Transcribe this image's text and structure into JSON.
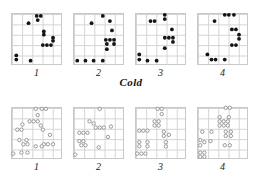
{
  "figure": {
    "title": "",
    "width": 262,
    "height": 189,
    "grid_rows": 5,
    "grid_cols": 5,
    "marker_colors": {
      "cold": "#141414",
      "warm": "#8e8e8e"
    },
    "grid_color": "#d2d2d2",
    "border_color": "#c9c9c9"
  },
  "groups": [
    {
      "key": "cold",
      "label": "Cold",
      "marker": "filled-circle"
    },
    {
      "key": "warm",
      "label": "Warm",
      "marker": "open-circle"
    }
  ],
  "panel_labels": [
    "1",
    "2",
    "3",
    "4"
  ],
  "chart_data": {
    "type": "scatter",
    "title": "",
    "xlabel": "",
    "ylabel": "",
    "xlim": [
      0,
      5
    ],
    "ylim": [
      0,
      5
    ],
    "grid": true,
    "legend": "none",
    "annotations": [
      "Cold",
      "Warm",
      "1",
      "2",
      "3",
      "4"
    ],
    "panels": [
      {
        "group": "Cold",
        "label": "1",
        "marker": "filled-circle",
        "points": [
          [
            2.52,
            4.72
          ],
          [
            2.92,
            4.72
          ],
          [
            2.62,
            4.32
          ],
          [
            1.72,
            4.02
          ],
          [
            3.22,
            3.22
          ],
          [
            3.22,
            2.92
          ],
          [
            4.12,
            2.62
          ],
          [
            4.12,
            2.32
          ],
          [
            3.12,
            1.92
          ],
          [
            3.52,
            1.92
          ],
          [
            3.92,
            1.92
          ],
          [
            0.52,
            0.92
          ],
          [
            0.52,
            0.52
          ],
          [
            1.92,
            0.42
          ]
        ]
      },
      {
        "group": "Cold",
        "label": "2",
        "marker": "filled-circle",
        "points": [
          [
            2.92,
            4.72
          ],
          [
            3.62,
            4.22
          ],
          [
            1.82,
            4.02
          ],
          [
            3.82,
            3.32
          ],
          [
            3.22,
            2.42
          ],
          [
            3.62,
            2.42
          ],
          [
            4.02,
            2.42
          ],
          [
            3.32,
            2.02
          ],
          [
            4.02,
            2.02
          ],
          [
            3.32,
            1.52
          ],
          [
            0.42,
            0.42
          ],
          [
            1.22,
            0.42
          ],
          [
            2.02,
            0.42
          ],
          [
            2.92,
            0.42
          ]
        ]
      },
      {
        "group": "Cold",
        "label": "3",
        "marker": "filled-circle",
        "points": [
          [
            2.92,
            4.82
          ],
          [
            2.92,
            4.42
          ],
          [
            1.52,
            4.22
          ],
          [
            1.92,
            4.22
          ],
          [
            3.62,
            3.42
          ],
          [
            2.92,
            2.62
          ],
          [
            3.32,
            2.62
          ],
          [
            3.72,
            2.62
          ],
          [
            3.72,
            2.22
          ],
          [
            2.92,
            1.62
          ],
          [
            0.42,
            1.02
          ],
          [
            0.42,
            0.52
          ],
          [
            1.22,
            0.42
          ],
          [
            2.12,
            0.42
          ]
        ]
      },
      {
        "group": "Cold",
        "label": "4",
        "marker": "filled-circle",
        "points": [
          [
            2.72,
            4.82
          ],
          [
            3.12,
            4.82
          ],
          [
            3.62,
            4.82
          ],
          [
            1.72,
            4.22
          ],
          [
            3.42,
            3.42
          ],
          [
            3.82,
            3.42
          ],
          [
            4.12,
            2.92
          ],
          [
            4.12,
            2.52
          ],
          [
            3.42,
            1.92
          ],
          [
            3.82,
            1.92
          ],
          [
            1.02,
            1.02
          ],
          [
            1.42,
            0.52
          ],
          [
            1.82,
            0.52
          ],
          [
            2.72,
            0.52
          ]
        ]
      },
      {
        "group": "Warm",
        "label": "1",
        "marker": "open-circle",
        "points": [
          [
            2.42,
            4.82
          ],
          [
            3.02,
            4.82
          ],
          [
            3.42,
            4.82
          ],
          [
            2.62,
            4.22
          ],
          [
            1.82,
            3.62
          ],
          [
            2.22,
            3.62
          ],
          [
            2.62,
            3.62
          ],
          [
            1.12,
            3.32
          ],
          [
            2.92,
            3.22
          ],
          [
            0.62,
            2.82
          ],
          [
            1.02,
            2.82
          ],
          [
            3.12,
            2.82
          ],
          [
            3.82,
            2.32
          ],
          [
            0.82,
            1.82
          ],
          [
            1.52,
            1.82
          ],
          [
            1.22,
            1.42
          ],
          [
            1.62,
            1.42
          ],
          [
            3.22,
            1.42
          ],
          [
            3.62,
            1.42
          ],
          [
            4.12,
            1.42
          ],
          [
            2.42,
            1.22
          ],
          [
            3.02,
            1.22
          ],
          [
            0.22,
            0.52
          ],
          [
            1.02,
            0.62
          ],
          [
            1.62,
            0.62
          ]
        ]
      },
      {
        "group": "Warm",
        "label": "2",
        "marker": "open-circle",
        "points": [
          [
            2.62,
            4.82
          ],
          [
            1.62,
            3.62
          ],
          [
            2.02,
            3.42
          ],
          [
            2.22,
            3.02
          ],
          [
            2.62,
            3.02
          ],
          [
            3.02,
            3.02
          ],
          [
            3.72,
            3.12
          ],
          [
            0.62,
            2.52
          ],
          [
            1.02,
            2.52
          ],
          [
            1.42,
            2.52
          ],
          [
            3.42,
            2.12
          ],
          [
            0.62,
            1.72
          ],
          [
            1.02,
            1.72
          ],
          [
            0.82,
            1.32
          ],
          [
            1.22,
            1.32
          ],
          [
            2.52,
            1.12
          ],
          [
            0.22,
            0.42
          ]
        ]
      },
      {
        "group": "Warm",
        "label": "3",
        "marker": "open-circle",
        "points": [
          [
            2.22,
            4.82
          ],
          [
            2.62,
            4.82
          ],
          [
            2.62,
            4.32
          ],
          [
            1.92,
            3.62
          ],
          [
            2.32,
            3.62
          ],
          [
            1.92,
            3.22
          ],
          [
            2.32,
            3.22
          ],
          [
            0.42,
            2.72
          ],
          [
            0.82,
            2.72
          ],
          [
            1.22,
            2.72
          ],
          [
            2.82,
            2.62
          ],
          [
            2.82,
            2.22
          ],
          [
            3.32,
            2.32
          ],
          [
            0.42,
            1.62
          ],
          [
            1.22,
            1.62
          ],
          [
            3.02,
            1.62
          ],
          [
            0.42,
            1.22
          ],
          [
            1.22,
            1.22
          ],
          [
            3.02,
            1.22
          ],
          [
            0.22,
            0.52
          ],
          [
            0.62,
            0.52
          ],
          [
            1.02,
            0.52
          ]
        ]
      },
      {
        "group": "Warm",
        "label": "4",
        "marker": "open-circle",
        "points": [
          [
            2.82,
            4.92
          ],
          [
            3.22,
            4.92
          ],
          [
            2.22,
            4.02
          ],
          [
            3.12,
            4.02
          ],
          [
            2.22,
            3.62
          ],
          [
            2.62,
            3.62
          ],
          [
            3.02,
            3.62
          ],
          [
            2.22,
            3.22
          ],
          [
            2.62,
            3.22
          ],
          [
            3.02,
            3.22
          ],
          [
            0.52,
            2.62
          ],
          [
            1.42,
            2.62
          ],
          [
            2.82,
            2.62
          ],
          [
            3.32,
            2.62
          ],
          [
            2.82,
            2.22
          ],
          [
            3.32,
            2.22
          ],
          [
            0.32,
            1.82
          ],
          [
            0.72,
            1.62
          ],
          [
            1.32,
            1.72
          ],
          [
            0.32,
            1.32
          ],
          [
            2.72,
            1.32
          ],
          [
            3.22,
            1.32
          ],
          [
            0.32,
            0.62
          ],
          [
            0.72,
            0.62
          ],
          [
            0.32,
            0.22
          ],
          [
            0.72,
            0.22
          ]
        ]
      }
    ]
  }
}
